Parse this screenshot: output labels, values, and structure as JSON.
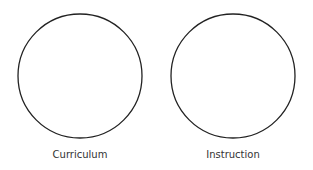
{
  "diagram": {
    "circles": [
      {
        "label": "Curriculum",
        "cx": 80,
        "cy": 76,
        "r": 62
      },
      {
        "label": "Instruction",
        "cx": 233,
        "cy": 76,
        "r": 62
      }
    ],
    "stroke_color": "#222222",
    "label_color": "#333333"
  }
}
